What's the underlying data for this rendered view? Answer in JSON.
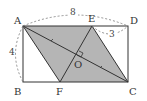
{
  "diagram": {
    "points": {
      "A": {
        "label": "A"
      },
      "B": {
        "label": "B"
      },
      "C": {
        "label": "C"
      },
      "D": {
        "label": "D"
      },
      "E": {
        "label": "E"
      },
      "F": {
        "label": "F"
      },
      "O": {
        "label": "O"
      }
    },
    "measurements": {
      "AD": "8",
      "AB": "4",
      "ED": "3"
    },
    "colors": {
      "shade": "#b5b5b5",
      "line": "#333333",
      "dash": "#777777"
    }
  }
}
